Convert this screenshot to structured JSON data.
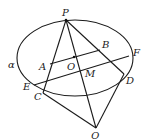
{
  "diagram": {
    "type": "geometry",
    "plane_label": "α",
    "ellipse": {
      "cx": 75,
      "cy": 58,
      "rx": 58,
      "ry": 38
    },
    "points": {
      "P": {
        "label": "P",
        "x": 66,
        "y": 20
      },
      "A": {
        "label": "A",
        "x": 50,
        "y": 64
      },
      "B": {
        "label": "B",
        "x": 100,
        "y": 50
      },
      "O": {
        "label": "O",
        "x": 74,
        "y": 57
      },
      "M": {
        "label": "M",
        "x": 82,
        "y": 68
      },
      "E": {
        "label": "E",
        "x": 34,
        "y": 85
      },
      "F": {
        "label": "F",
        "x": 129,
        "y": 56
      },
      "C": {
        "label": "C",
        "x": 43,
        "y": 93
      },
      "D": {
        "label": "D",
        "x": 124,
        "y": 74
      },
      "Q": {
        "label": "Q",
        "x": 96,
        "y": 128
      }
    },
    "segments": [
      "PC",
      "PQ",
      "PD",
      "AB",
      "EF",
      "CQ",
      "DQ"
    ]
  }
}
